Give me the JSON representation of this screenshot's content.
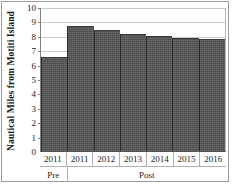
{
  "chart_data": {
    "type": "bar",
    "title": "",
    "xlabel": "",
    "ylabel": "Nautical Miles from Motiti Island",
    "ylim": [
      0,
      10
    ],
    "ytick_labels": [
      "10",
      "9",
      "8",
      "7",
      "6",
      "5",
      "4",
      "3",
      "2",
      "1",
      "0"
    ],
    "ytick_values": [
      10,
      9,
      8,
      7,
      6,
      5,
      4,
      3,
      2,
      1,
      0
    ],
    "grid": true,
    "legend": "none",
    "categories": [
      "2011",
      "2011",
      "2012",
      "2013",
      "2014",
      "2015",
      "2016"
    ],
    "values": [
      6.5,
      8.65,
      8.4,
      8.15,
      8.0,
      7.85,
      7.8
    ],
    "groups": [
      {
        "label": "Pre",
        "span": 1
      },
      {
        "label": "Post",
        "span": 6
      }
    ],
    "bar_color": "#4b4b4b",
    "gridline_color": "#c9c9c9",
    "axis_color": "#555555"
  },
  "caption": {
    "text": ""
  }
}
